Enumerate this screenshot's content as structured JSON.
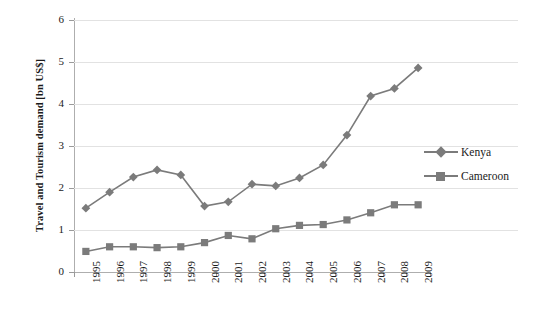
{
  "chart_data": {
    "type": "line",
    "title": "",
    "xlabel": "",
    "ylabel": "Travel and Tourism demand [bn US$]",
    "ylim": [
      0,
      6
    ],
    "yticks": [
      "0",
      "1",
      "2",
      "3",
      "4",
      "5",
      "6"
    ],
    "grid": true,
    "legend_position": "right",
    "categories": [
      "1995",
      "1996",
      "1997",
      "1998",
      "1999",
      "2000",
      "2001",
      "2002",
      "2003",
      "2004",
      "2005",
      "2006",
      "2007",
      "2008",
      "2009"
    ],
    "series": [
      {
        "name": "Kenya",
        "marker": "diamond",
        "color": "#7b7b7b",
        "values": [
          1.52,
          1.9,
          2.26,
          2.43,
          2.31,
          1.57,
          1.67,
          2.09,
          2.05,
          2.24,
          2.55,
          3.26,
          4.19,
          4.37,
          4.86
        ]
      },
      {
        "name": "Cameroon",
        "marker": "square",
        "color": "#7b7b7b",
        "values": [
          0.49,
          0.6,
          0.6,
          0.58,
          0.6,
          0.7,
          0.87,
          0.79,
          1.03,
          1.11,
          1.13,
          1.24,
          1.41,
          1.6,
          1.6
        ]
      }
    ]
  },
  "legend": {
    "items": [
      {
        "label": "Kenya"
      },
      {
        "label": "Cameroon"
      }
    ]
  },
  "colors": {
    "series": "#7b7b7b",
    "grid": "#e2e2e2",
    "axis": "#aeaeae",
    "text": "#1a1a1a",
    "background": "#ffffff"
  }
}
